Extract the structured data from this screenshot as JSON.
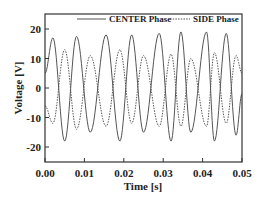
{
  "chart_data": {
    "type": "line",
    "title": "",
    "xlabel": "Time [s]",
    "ylabel": "Voltage [V]",
    "xlim": [
      0.0,
      0.05
    ],
    "ylim": [
      -25,
      25
    ],
    "xticks": [
      "0.00",
      "0.01",
      "0.02",
      "0.03",
      "0.04",
      "0.05"
    ],
    "yticks": [
      "20",
      "10",
      "0",
      "-10",
      "-20"
    ],
    "grid": false,
    "legend_position": "top",
    "series": [
      {
        "name": "CENTER Phase",
        "style": "solid",
        "color": "#555555",
        "x": [
          0.0,
          0.002,
          0.005,
          0.008,
          0.0115,
          0.0155,
          0.019,
          0.022,
          0.025,
          0.029,
          0.032,
          0.0345,
          0.037,
          0.041,
          0.043,
          0.046,
          0.0485,
          0.05
        ],
        "y": [
          5,
          17,
          -18,
          17.5,
          -15,
          18,
          -18,
          18,
          -15,
          18.5,
          -18,
          19,
          -15,
          19,
          -18,
          18.5,
          -16,
          -2
        ]
      },
      {
        "name": "SIDE Phase",
        "style": "dashed",
        "color": "#555555",
        "x": [
          0.0,
          0.002,
          0.005,
          0.008,
          0.0115,
          0.0155,
          0.019,
          0.022,
          0.025,
          0.029,
          0.032,
          0.0345,
          0.037,
          0.041,
          0.043,
          0.046,
          0.0485,
          0.05
        ],
        "y": [
          -6,
          -12,
          13,
          -14,
          11,
          -13,
          13,
          -12,
          11,
          -13,
          11.5,
          -13,
          10,
          -13,
          12,
          -12,
          11,
          5
        ]
      }
    ]
  },
  "legend": {
    "center_label": "CENTER Phase",
    "side_label": "SIDE Phase"
  },
  "axes": {
    "xlabel": "Time [s]",
    "ylabel": "Voltage [V]"
  }
}
